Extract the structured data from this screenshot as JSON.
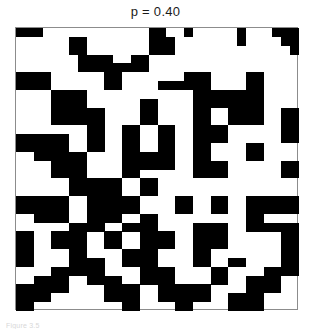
{
  "figure": {
    "title": "p = 0.40",
    "caption": "Figure 3.5",
    "colors": {
      "occupied": "#000000",
      "empty": "#ffffff",
      "frame": "#8c8c8c",
      "title_text": "#1b1b1b",
      "caption_text": "#d8d8d8"
    }
  },
  "chart_data": {
    "type": "heatmap",
    "title": "p = 0.40",
    "xlabel": "",
    "ylabel": "",
    "grid": false,
    "legend_position": "none",
    "probability": 0.4,
    "rows": 32,
    "cols": 32,
    "cell_size_px": 8.84,
    "value_labels": {
      "1": "occupied",
      "0": "empty"
    },
    "colorscale": [
      "#ffffff",
      "#000000"
    ],
    "zlim": [
      0,
      1
    ],
    "values": [
      [
        1,
        1,
        1,
        0,
        0,
        0,
        0,
        0,
        0,
        0,
        0,
        0,
        0,
        0,
        0,
        1,
        1,
        0,
        0,
        1,
        0,
        0,
        0,
        0,
        0,
        1,
        0,
        0,
        0,
        1,
        1,
        1
      ],
      [
        0,
        0,
        0,
        0,
        0,
        0,
        1,
        1,
        0,
        0,
        0,
        0,
        0,
        0,
        0,
        1,
        1,
        1,
        0,
        0,
        0,
        0,
        0,
        0,
        0,
        1,
        0,
        0,
        0,
        0,
        1,
        1
      ],
      [
        0,
        0,
        0,
        0,
        0,
        0,
        1,
        1,
        0,
        0,
        0,
        0,
        0,
        0,
        0,
        1,
        1,
        1,
        0,
        0,
        0,
        0,
        0,
        0,
        0,
        0,
        0,
        0,
        0,
        0,
        0,
        1
      ],
      [
        0,
        0,
        0,
        0,
        0,
        0,
        0,
        1,
        1,
        1,
        1,
        0,
        0,
        1,
        1,
        0,
        0,
        0,
        0,
        0,
        0,
        0,
        0,
        0,
        0,
        0,
        0,
        0,
        0,
        0,
        0,
        0
      ],
      [
        0,
        0,
        0,
        0,
        0,
        0,
        0,
        1,
        1,
        1,
        1,
        1,
        1,
        1,
        1,
        0,
        0,
        0,
        0,
        0,
        0,
        0,
        0,
        0,
        0,
        0,
        0,
        0,
        0,
        0,
        0,
        0
      ],
      [
        1,
        1,
        1,
        1,
        0,
        0,
        0,
        0,
        0,
        0,
        1,
        1,
        0,
        0,
        0,
        0,
        0,
        0,
        0,
        1,
        1,
        1,
        0,
        0,
        0,
        0,
        1,
        1,
        0,
        0,
        0,
        0
      ],
      [
        1,
        1,
        1,
        1,
        0,
        0,
        0,
        0,
        0,
        0,
        1,
        1,
        0,
        0,
        0,
        0,
        1,
        1,
        1,
        1,
        1,
        1,
        0,
        0,
        0,
        0,
        1,
        1,
        0,
        0,
        0,
        0
      ],
      [
        0,
        0,
        0,
        0,
        1,
        1,
        1,
        1,
        0,
        0,
        0,
        0,
        0,
        0,
        0,
        0,
        0,
        0,
        0,
        0,
        1,
        1,
        1,
        1,
        1,
        1,
        1,
        1,
        0,
        0,
        0,
        0
      ],
      [
        0,
        0,
        0,
        0,
        1,
        1,
        1,
        1,
        0,
        0,
        0,
        0,
        0,
        0,
        1,
        1,
        0,
        0,
        0,
        0,
        1,
        1,
        1,
        1,
        1,
        1,
        1,
        1,
        0,
        0,
        0,
        0
      ],
      [
        0,
        0,
        0,
        0,
        1,
        1,
        1,
        1,
        1,
        1,
        0,
        0,
        0,
        0,
        1,
        1,
        0,
        0,
        0,
        0,
        1,
        1,
        0,
        0,
        1,
        1,
        1,
        1,
        0,
        0,
        1,
        1
      ],
      [
        0,
        0,
        0,
        0,
        1,
        1,
        1,
        1,
        1,
        1,
        0,
        0,
        0,
        0,
        1,
        1,
        0,
        0,
        0,
        0,
        1,
        1,
        0,
        0,
        1,
        1,
        1,
        1,
        0,
        0,
        1,
        1
      ],
      [
        0,
        0,
        0,
        0,
        0,
        0,
        0,
        0,
        1,
        1,
        0,
        0,
        1,
        1,
        0,
        0,
        1,
        1,
        0,
        0,
        1,
        1,
        1,
        1,
        0,
        0,
        0,
        0,
        0,
        0,
        1,
        1
      ],
      [
        1,
        1,
        1,
        1,
        1,
        1,
        0,
        0,
        1,
        1,
        0,
        0,
        1,
        1,
        0,
        0,
        1,
        1,
        0,
        0,
        1,
        1,
        1,
        1,
        0,
        0,
        0,
        0,
        0,
        0,
        1,
        1
      ],
      [
        1,
        1,
        1,
        1,
        1,
        1,
        0,
        0,
        1,
        1,
        0,
        0,
        1,
        1,
        0,
        0,
        1,
        1,
        0,
        0,
        1,
        1,
        0,
        0,
        0,
        0,
        1,
        1,
        0,
        0,
        0,
        0
      ],
      [
        0,
        0,
        1,
        1,
        1,
        1,
        1,
        1,
        0,
        0,
        0,
        0,
        1,
        1,
        1,
        1,
        1,
        1,
        0,
        0,
        1,
        1,
        0,
        0,
        0,
        0,
        1,
        1,
        0,
        0,
        0,
        0
      ],
      [
        0,
        0,
        0,
        0,
        1,
        1,
        1,
        1,
        0,
        0,
        0,
        0,
        1,
        1,
        1,
        1,
        1,
        1,
        0,
        0,
        1,
        1,
        1,
        1,
        0,
        0,
        0,
        0,
        0,
        0,
        1,
        1
      ],
      [
        0,
        0,
        0,
        0,
        1,
        1,
        1,
        1,
        0,
        0,
        0,
        0,
        1,
        1,
        0,
        0,
        0,
        0,
        0,
        0,
        1,
        1,
        1,
        1,
        0,
        0,
        0,
        0,
        0,
        0,
        1,
        1
      ],
      [
        0,
        0,
        0,
        0,
        0,
        0,
        1,
        1,
        1,
        1,
        1,
        1,
        0,
        0,
        1,
        1,
        0,
        0,
        0,
        0,
        0,
        0,
        0,
        0,
        0,
        0,
        0,
        0,
        0,
        0,
        0,
        0
      ],
      [
        0,
        0,
        0,
        0,
        0,
        0,
        1,
        1,
        1,
        1,
        1,
        1,
        0,
        0,
        1,
        1,
        0,
        0,
        0,
        0,
        0,
        0,
        0,
        0,
        0,
        0,
        0,
        0,
        0,
        0,
        0,
        0
      ],
      [
        1,
        1,
        1,
        1,
        1,
        1,
        0,
        0,
        1,
        1,
        1,
        1,
        1,
        1,
        0,
        0,
        0,
        0,
        1,
        1,
        0,
        0,
        1,
        1,
        0,
        0,
        1,
        1,
        1,
        1,
        1,
        1
      ],
      [
        1,
        1,
        1,
        1,
        1,
        1,
        0,
        0,
        1,
        1,
        1,
        1,
        1,
        1,
        0,
        0,
        0,
        0,
        1,
        1,
        0,
        0,
        1,
        1,
        0,
        0,
        1,
        1,
        1,
        1,
        1,
        1
      ],
      [
        0,
        0,
        1,
        1,
        1,
        1,
        0,
        0,
        1,
        1,
        1,
        1,
        0,
        0,
        1,
        1,
        0,
        0,
        0,
        0,
        0,
        0,
        0,
        0,
        0,
        0,
        1,
        1,
        0,
        0,
        0,
        0
      ],
      [
        0,
        0,
        0,
        0,
        0,
        0,
        1,
        1,
        1,
        1,
        0,
        0,
        1,
        1,
        1,
        1,
        0,
        0,
        0,
        0,
        1,
        1,
        1,
        1,
        0,
        0,
        1,
        1,
        1,
        1,
        1,
        1
      ],
      [
        1,
        1,
        0,
        0,
        1,
        1,
        1,
        1,
        0,
        0,
        1,
        1,
        0,
        0,
        1,
        1,
        1,
        1,
        0,
        0,
        1,
        1,
        1,
        1,
        0,
        0,
        0,
        0,
        0,
        0,
        1,
        1
      ],
      [
        1,
        1,
        0,
        0,
        1,
        1,
        1,
        1,
        0,
        0,
        1,
        1,
        0,
        0,
        1,
        1,
        1,
        1,
        0,
        0,
        1,
        1,
        1,
        1,
        0,
        0,
        0,
        0,
        0,
        0,
        1,
        1
      ],
      [
        1,
        1,
        0,
        0,
        0,
        0,
        1,
        1,
        0,
        0,
        0,
        0,
        1,
        1,
        1,
        1,
        0,
        0,
        0,
        0,
        1,
        1,
        0,
        0,
        0,
        0,
        0,
        0,
        0,
        0,
        1,
        1
      ],
      [
        1,
        1,
        0,
        0,
        0,
        0,
        1,
        1,
        1,
        1,
        0,
        0,
        1,
        1,
        1,
        1,
        0,
        0,
        0,
        0,
        1,
        1,
        0,
        0,
        1,
        1,
        0,
        0,
        0,
        0,
        1,
        1
      ],
      [
        0,
        0,
        0,
        0,
        1,
        1,
        1,
        1,
        1,
        1,
        0,
        0,
        0,
        0,
        1,
        1,
        1,
        1,
        0,
        0,
        0,
        0,
        1,
        1,
        0,
        0,
        0,
        0,
        1,
        1,
        1,
        1
      ],
      [
        0,
        0,
        1,
        1,
        1,
        1,
        0,
        0,
        1,
        1,
        1,
        1,
        0,
        0,
        1,
        1,
        1,
        1,
        0,
        0,
        0,
        0,
        1,
        1,
        0,
        0,
        1,
        1,
        1,
        1,
        0,
        0
      ],
      [
        1,
        1,
        1,
        1,
        1,
        1,
        0,
        0,
        0,
        0,
        1,
        1,
        1,
        1,
        0,
        0,
        1,
        1,
        1,
        1,
        1,
        1,
        0,
        0,
        0,
        0,
        1,
        1,
        1,
        1,
        0,
        0
      ],
      [
        1,
        1,
        1,
        1,
        0,
        0,
        0,
        0,
        0,
        0,
        1,
        1,
        1,
        1,
        0,
        0,
        1,
        1,
        1,
        1,
        1,
        1,
        0,
        0,
        1,
        1,
        1,
        1,
        0,
        0,
        0,
        0
      ],
      [
        1,
        1,
        0,
        0,
        0,
        0,
        0,
        0,
        0,
        0,
        0,
        0,
        1,
        1,
        0,
        0,
        0,
        0,
        1,
        1,
        0,
        0,
        0,
        0,
        1,
        1,
        1,
        1,
        0,
        0,
        0,
        0
      ]
    ]
  }
}
